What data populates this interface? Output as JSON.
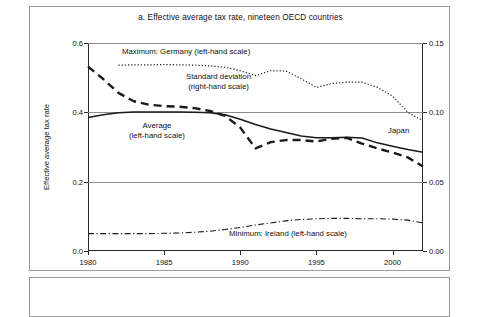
{
  "figure": {
    "title": "a. Effective average tax rate, nineteen OECD countries"
  },
  "axes": {
    "left_label": "Effective average tax rate",
    "left_ticks": [
      "0.0",
      "0.2",
      "0.4",
      "0.6"
    ],
    "right_ticks": [
      "0.00",
      "0.05",
      "0.10",
      "0.15"
    ],
    "x_ticks": [
      "1980",
      "1985",
      "1990",
      "1995",
      "2000"
    ]
  },
  "annotations": {
    "maximum": "Maximum: Germany (left-hand scale)",
    "stddev_line1": "Standard deviation",
    "stddev_line2": "(right-hand scale)",
    "average_line1": "Average",
    "average_line2": "(left-hand scale)",
    "minimum": "Minimum: Ireland (left-hand scale)",
    "japan": "Japan"
  },
  "colors": {
    "ink": "#1a1a1a",
    "frame": "#2a2a2a",
    "grid": "#8d8d8d",
    "box": "#9a9a9a"
  },
  "chart_data": {
    "type": "line",
    "title": "a. Effective average tax rate, nineteen OECD countries",
    "xlabel": "",
    "ylabel": "Effective average tax rate",
    "y2label": "Standard deviation",
    "xlim": [
      1980,
      2002
    ],
    "ylim": [
      0.0,
      0.6
    ],
    "y2lim": [
      0.0,
      0.15
    ],
    "grid": true,
    "legend_position": "inline-annotations",
    "x": [
      1980,
      1981,
      1982,
      1983,
      1984,
      1985,
      1986,
      1987,
      1988,
      1989,
      1990,
      1991,
      1992,
      1993,
      1994,
      1995,
      1996,
      1997,
      1998,
      1999,
      2000,
      2001,
      2002
    ],
    "series": [
      {
        "name": "Maximum: Germany (left-hand scale)",
        "axis": "left",
        "style": "dotted",
        "values": [
          null,
          null,
          0.536,
          0.537,
          0.537,
          0.538,
          0.537,
          0.536,
          0.534,
          0.53,
          0.52,
          0.506,
          0.52,
          0.519,
          0.497,
          0.472,
          0.483,
          0.487,
          0.487,
          0.472,
          0.447,
          0.4,
          0.376
        ]
      },
      {
        "name": "Standard deviation (right-hand scale)",
        "axis": "right",
        "style": "dashed",
        "values": [
          0.133,
          0.124,
          0.114,
          0.108,
          0.1055,
          0.1045,
          0.104,
          0.103,
          0.101,
          0.0975,
          0.089,
          0.074,
          0.0785,
          0.08,
          0.08,
          0.079,
          0.081,
          0.0815,
          0.0775,
          0.074,
          0.071,
          0.0675,
          0.061
        ]
      },
      {
        "name": "Average (left-hand scale)",
        "axis": "left",
        "style": "solid",
        "values": [
          0.385,
          0.393,
          0.399,
          0.401,
          0.401,
          0.401,
          0.401,
          0.4,
          0.399,
          0.393,
          0.38,
          0.365,
          0.352,
          0.342,
          0.332,
          0.327,
          0.327,
          0.328,
          0.326,
          0.312,
          0.302,
          0.293,
          0.285
        ]
      },
      {
        "name": "Minimum: Ireland (left-hand scale)",
        "axis": "left",
        "style": "dashdot",
        "values": [
          0.05,
          0.05,
          0.05,
          0.05,
          0.05,
          0.051,
          0.052,
          0.054,
          0.057,
          0.062,
          0.068,
          0.075,
          0.081,
          0.087,
          0.091,
          0.093,
          0.094,
          0.094,
          0.093,
          0.093,
          0.092,
          0.089,
          0.081
        ]
      }
    ],
    "point_annotations": [
      {
        "label": "Japan",
        "x": 2000,
        "note": "marks the maximum-country switch at the end of the dotted series"
      }
    ]
  }
}
